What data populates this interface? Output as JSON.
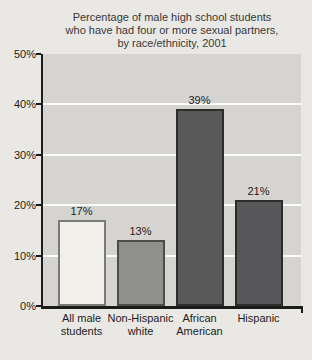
{
  "figure": {
    "background": "#eae8e4"
  },
  "chart_data": {
    "type": "bar",
    "title": "Percentage of male high school students\nwho have had four or more sexual partners,\nby race/ethnicity, 2001",
    "categories": [
      "All male\nstudents",
      "Non-Hispanic\nwhite",
      "African\nAmerican",
      "Hispanic"
    ],
    "values": [
      17,
      13,
      39,
      21
    ],
    "value_labels": [
      "17%",
      "13%",
      "39%",
      "21%"
    ],
    "xlabel": "",
    "ylabel": "",
    "ylim": [
      0,
      50
    ],
    "ytick_values": [
      0,
      10,
      20,
      30,
      40,
      50
    ],
    "ytick_labels": [
      "0%",
      "10%",
      "20%",
      "30%",
      "40%",
      "50%"
    ],
    "gridline_values": [
      10,
      20,
      30,
      40
    ],
    "grid": true,
    "legend": "none",
    "colors": {
      "plot_background": "#d5d4d1",
      "gridline": "#fcfcfa",
      "axis": "#1b1b1b",
      "title_text": "#383838",
      "label_text": "#1c1c1c",
      "bar_fills": [
        "#f1f0ea",
        "#90908c",
        "#59595a",
        "#58585a"
      ],
      "bar_borders": [
        "#7a7a78",
        "#4c4c4a",
        "#2c2c2c",
        "#2c2c2c"
      ]
    }
  }
}
